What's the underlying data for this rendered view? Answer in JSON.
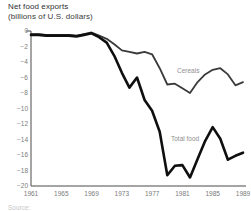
{
  "header": {
    "title_line1": "Net food exports",
    "title_line2": "(billions of U.S. dollars)"
  },
  "source_note": "Source:",
  "chart_data": {
    "type": "line",
    "title": "Net food exports (billions of U.S. dollars)",
    "x": [
      1961,
      1962,
      1963,
      1964,
      1965,
      1966,
      1967,
      1968,
      1969,
      1970,
      1971,
      1972,
      1973,
      1974,
      1975,
      1976,
      1977,
      1978,
      1979,
      1980,
      1981,
      1982,
      1983,
      1984,
      1985,
      1986,
      1987,
      1988,
      1989
    ],
    "series": [
      {
        "name": "Cereals",
        "color": "#3a3a3a",
        "stroke_width": 1.8,
        "label_x": 177,
        "label_y": 73,
        "values": [
          -0.4,
          -0.4,
          -0.5,
          -0.5,
          -0.5,
          -0.5,
          -0.6,
          -0.4,
          -0.2,
          -0.6,
          -1.0,
          -1.7,
          -2.5,
          -2.7,
          -2.9,
          -2.7,
          -3.0,
          -4.8,
          -6.9,
          -6.8,
          -7.4,
          -8.0,
          -6.6,
          -5.6,
          -5.0,
          -4.8,
          -5.6,
          -7.0,
          -6.6
        ]
      },
      {
        "name": "Total food",
        "color": "#0f0f0f",
        "stroke_width": 2.6,
        "label_x": 171,
        "label_y": 141,
        "values": [
          -0.5,
          -0.5,
          -0.6,
          -0.6,
          -0.6,
          -0.6,
          -0.7,
          -0.5,
          -0.3,
          -0.8,
          -1.5,
          -3.2,
          -5.4,
          -7.3,
          -6.0,
          -8.9,
          -10.3,
          -13.0,
          -18.6,
          -17.4,
          -17.3,
          -18.9,
          -16.5,
          -14.2,
          -12.4,
          -13.9,
          -16.6,
          -16.1,
          -15.7
        ]
      }
    ],
    "xlabel": "",
    "ylabel": "",
    "xlim": [
      1961,
      1989
    ],
    "ylim": [
      -20,
      0
    ],
    "yticks": [
      0,
      -2,
      -4,
      -6,
      -8,
      -10,
      -12,
      -14,
      -16,
      -18,
      -20
    ],
    "xticks": [
      1961,
      1965,
      1969,
      1973,
      1977,
      1981,
      1985,
      1989
    ],
    "grid": false,
    "legend": "inline-labels",
    "colors": {
      "axis": "#4a4a4a",
      "tick_label": "#7a7a7a",
      "series_label": "#8f8f8f"
    }
  }
}
